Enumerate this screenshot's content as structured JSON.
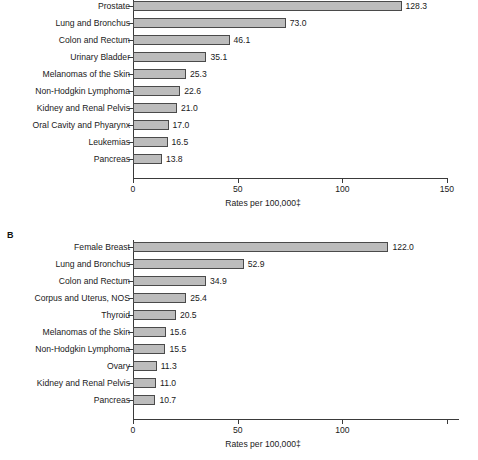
{
  "figure": {
    "background": "#ffffff",
    "bar_fill": "#bcbcbc",
    "bar_stroke": "#4a4a4a",
    "axis_color": "#3a3a3a",
    "text_color": "#1a1a1a"
  },
  "panels": [
    {
      "letter": "",
      "letter_visible": false,
      "axis_title": "Rates per 100,000‡",
      "xticks": [
        "0",
        "50",
        "100",
        "150"
      ],
      "xtick_values": [
        0,
        50,
        100,
        150
      ],
      "xlim": [
        0,
        150
      ],
      "categories": [
        "Prostate",
        "Lung and Bronchus",
        "Colon and Rectum",
        "Urinary Bladder",
        "Melanomas of the Skin",
        "Non-Hodgkin Lymphoma",
        "Kidney and Renal Pelvis",
        "Oral Cavity and Phyarynx",
        "Leukemias",
        "Pancreas"
      ],
      "values": [
        128.3,
        73.0,
        46.1,
        35.1,
        25.3,
        22.6,
        21.0,
        17.0,
        16.5,
        13.8
      ],
      "value_labels": [
        "128.3",
        "73.0",
        "46.1",
        "35.1",
        "25.3",
        "22.6",
        "21.0",
        "17.0",
        "16.5",
        "13.8"
      ]
    },
    {
      "letter": "B",
      "letter_visible": true,
      "axis_title": "Rates per 100,000‡",
      "xticks": [
        "0",
        "50",
        "100",
        ""
      ],
      "xtick_values": [
        0,
        50,
        100,
        150
      ],
      "xlim": [
        0,
        155
      ],
      "categories": [
        "Female Breast",
        "Lung and Bronchus",
        "Colon and Rectum",
        "Corpus and Uterus, NOS",
        "Thyroid",
        "Melanomas of the Skin",
        "Non-Hodgkin Lymphoma",
        "Ovary",
        "Kidney and Renal Pelvis",
        "Pancreas"
      ],
      "values": [
        122.0,
        52.9,
        34.9,
        25.4,
        20.5,
        15.6,
        15.5,
        11.3,
        11.0,
        10.7
      ],
      "value_labels": [
        "122.0",
        "52.9",
        "34.9",
        "25.4",
        "20.5",
        "15.6",
        "15.5",
        "11.3",
        "11.0",
        "10.7"
      ]
    }
  ],
  "chart_data": [
    {
      "type": "bar",
      "orientation": "horizontal",
      "panel": "A",
      "title": "",
      "xlabel": "Rates per 100,000‡",
      "ylabel": "",
      "xlim": [
        0,
        150
      ],
      "xticks": [
        0,
        50,
        100,
        150
      ],
      "grid": false,
      "legend": "none",
      "categories": [
        "Prostate",
        "Lung and Bronchus",
        "Colon and Rectum",
        "Urinary Bladder",
        "Melanomas of the Skin",
        "Non-Hodgkin Lymphoma",
        "Kidney and Renal Pelvis",
        "Oral Cavity and Phyarynx",
        "Leukemias",
        "Pancreas"
      ],
      "values": [
        128.3,
        73.0,
        46.1,
        35.1,
        25.3,
        22.6,
        21.0,
        17.0,
        16.5,
        13.8
      ],
      "data_labels": [
        "128.3",
        "73.0",
        "46.1",
        "35.1",
        "25.3",
        "22.6",
        "21.0",
        "17.0",
        "16.5",
        "13.8"
      ]
    },
    {
      "type": "bar",
      "orientation": "horizontal",
      "panel": "B",
      "title": "B",
      "xlabel": "Rates per 100,000‡",
      "ylabel": "",
      "xlim": [
        0,
        155
      ],
      "xticks": [
        0,
        50,
        100,
        150
      ],
      "grid": false,
      "legend": "none",
      "categories": [
        "Female Breast",
        "Lung and Bronchus",
        "Colon and Rectum",
        "Corpus and Uterus, NOS",
        "Thyroid",
        "Melanomas of the Skin",
        "Non-Hodgkin Lymphoma",
        "Ovary",
        "Kidney and Renal Pelvis",
        "Pancreas"
      ],
      "values": [
        122.0,
        52.9,
        34.9,
        25.4,
        20.5,
        15.6,
        15.5,
        11.3,
        11.0,
        10.7
      ],
      "data_labels": [
        "122.0",
        "52.9",
        "34.9",
        "25.4",
        "20.5",
        "15.6",
        "15.5",
        "11.3",
        "11.0",
        "10.7"
      ]
    }
  ]
}
